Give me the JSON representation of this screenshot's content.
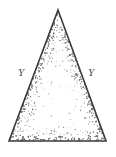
{
  "figure": {
    "name": "stippled-isosceles-triangle",
    "background_color": "#ffffff",
    "outline_color": "#3a3a3a",
    "stipple_color": "#6f6f6f",
    "label_color": "#4a4a4a",
    "canvas": {
      "width": 116,
      "height": 157
    },
    "geometry": {
      "apex": {
        "x": 58,
        "y": 10
      },
      "base_left": {
        "x": 9,
        "y": 141
      },
      "base_right": {
        "x": 106,
        "y": 141
      },
      "points": "58,10 106,141 9,141"
    },
    "labels": {
      "left_side": {
        "text": "Y",
        "x": 18,
        "y": 66
      },
      "right_side": {
        "text": "Y",
        "x": 88,
        "y": 66
      }
    }
  }
}
